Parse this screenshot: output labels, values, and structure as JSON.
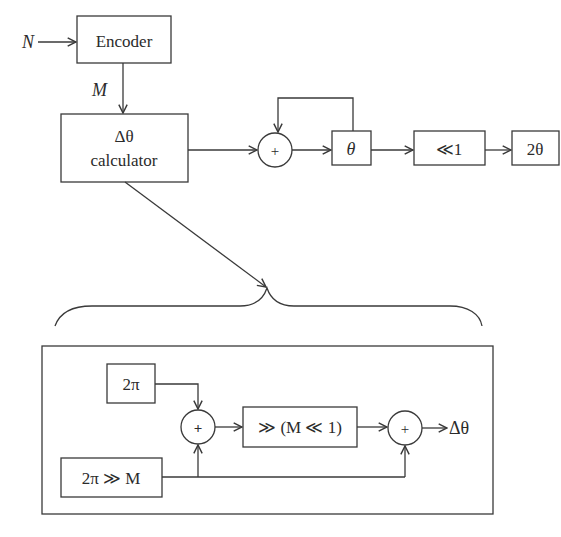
{
  "diagram": {
    "title": "",
    "top": {
      "input_label": "N",
      "encoder_label": "Encoder",
      "encoder_output_label": "M",
      "calculator_line1": "Δθ",
      "calculator_line2": "calculator",
      "adder_symbol": "+",
      "theta_label": "θ",
      "shift_label": "≪1",
      "output_label": "2θ"
    },
    "detail": {
      "two_pi_label": "2π",
      "two_pi_shift_label": "2π ≫ M",
      "adder1_symbol": "+",
      "shift_block_label": "≫ (M ≪ 1)",
      "adder2_symbol": "+",
      "output_label": "Δθ"
    }
  }
}
